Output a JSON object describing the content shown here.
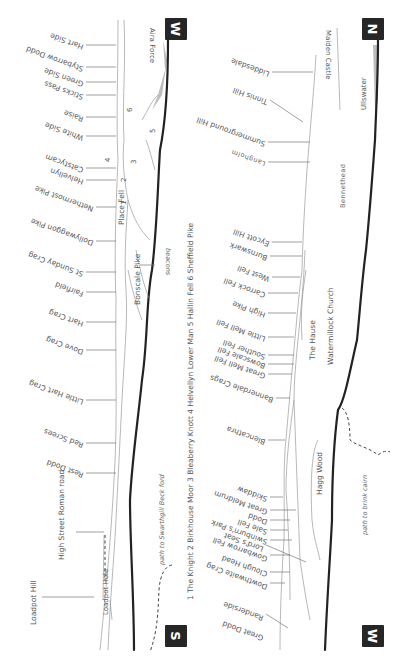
{
  "diagram": {
    "orientation": "rotated 90 degrees clockwise; panorama from a lakeside viewpoint",
    "compass": {
      "top_left": "W",
      "top_right": "N",
      "bottom_left": "S",
      "bottom_right": "W"
    },
    "key": {
      "text": "1 The Knight  2 Birkhouse Moor  3 Bleaberry Knott  4 Helvellyn Lower Man  5 Hallin Fell  6 Sheffield Pike",
      "items": [
        {
          "num": "1",
          "name": "The Knight"
        },
        {
          "num": "2",
          "name": "Birkhouse Moor"
        },
        {
          "num": "3",
          "name": "Bleaberry Knott"
        },
        {
          "num": "4",
          "name": "Helvellyn Lower Man"
        },
        {
          "num": "5",
          "name": "Hallin Fell"
        },
        {
          "num": "6",
          "name": "Sheffield Pike"
        }
      ]
    },
    "left_panel_peaks": [
      "Hart Side",
      "Stybarrow Dodd",
      "Green Side",
      "Sticks Pass",
      "Raise",
      "White Side",
      "Catstycam",
      "Helvellyn",
      "Nethermost Pike",
      "Dollywaggon Pike",
      "St Sunday Crag",
      "Fairfield",
      "Hart Crag",
      "Dove Crag",
      "Little Hart Crag",
      "Red Screes",
      "Rest Dodd",
      "High Street Roman road",
      "Loadpot Hill"
    ],
    "left_panel_features": {
      "aira_force": "Aira Force",
      "place_fell": "Place Fell",
      "bonscale_pike": "Bonscale Pike",
      "beacons": "beacons",
      "loadpot_hole": "Loadpot Hole",
      "path_swarthgill": "path to Swarthgill Beck ford",
      "ridge_numbers": [
        "6",
        "5",
        "4",
        "3",
        "2",
        "1"
      ]
    },
    "right_panel_peaks": [
      "Liddesdale",
      "Tinnis Hill",
      "Summerground Hill",
      "Langholm",
      "Eycott Hill",
      "Burnswark",
      "West Fell",
      "Carrock Fell",
      "High Pike",
      "Little Mell Fell",
      "Souther Fell",
      "Bowscale Fell",
      "Great Mell Fell",
      "Bannerdale Crags",
      "Blencathra",
      "Skiddaw",
      "Great Meldrum",
      "Dodd",
      "Sale Fell",
      "Swinburn's Park",
      "Lord's Seat",
      "Gowbarrow Fell",
      "Clough Head",
      "Dowthwaite Crag",
      "Randerside",
      "Great Dodd"
    ],
    "right_panel_features": {
      "maiden_castle": "Maiden Castle",
      "ullswater": "Ullswater",
      "bennethead": "Bennethead",
      "the_hause": "The Hause",
      "watermillock_church": "Watermillock Church",
      "hagg_wood": "Hagg Wood",
      "path_brink": "path to brink cairn"
    },
    "colors": {
      "ink": "#555555",
      "shoreline": "#222222",
      "water": "#bdbdbd",
      "compass_box": "#262626"
    }
  }
}
